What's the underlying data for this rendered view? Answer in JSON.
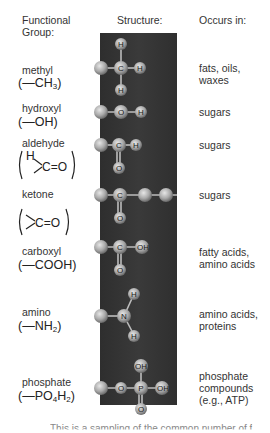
{
  "headers": {
    "group": "Functional Group:",
    "group_line1": "Functional",
    "group_line2": "Group:",
    "structure": "Structure:",
    "occurs": "Occurs in:"
  },
  "groups": [
    {
      "name": "methyl",
      "formula_prefix": "(—CH",
      "formula_sub": "3",
      "formula_suffix": ")",
      "occurs": "fats, oils,\nwaxes",
      "structure_atoms": [
        "C",
        "H",
        "H",
        "H"
      ]
    },
    {
      "name": "hydroxyl",
      "formula_prefix": "(—OH)",
      "formula_sub": "",
      "formula_suffix": "",
      "occurs": "sugars",
      "structure_atoms": [
        "O",
        "H"
      ]
    },
    {
      "name": "aldehyde",
      "formula_prefix": "H",
      "formula_sub": "",
      "formula_suffix": "C=O",
      "occurs": "sugars",
      "structure_atoms": [
        "C",
        "H",
        "O"
      ]
    },
    {
      "name": "ketone",
      "formula_prefix": "",
      "formula_sub": "",
      "formula_suffix": "C=O",
      "occurs": "sugars",
      "structure_atoms": [
        "C",
        "O"
      ]
    },
    {
      "name": "carboxyl",
      "formula_prefix": "(—COOH)",
      "formula_sub": "",
      "formula_suffix": "",
      "occurs": "fatty acids,\namino acids",
      "structure_atoms": [
        "C",
        "OH",
        "O"
      ]
    },
    {
      "name": "amino",
      "formula_prefix": "(—NH",
      "formula_sub": "2",
      "formula_suffix": ")",
      "occurs": "amino acids,\nproteins",
      "structure_atoms": [
        "N",
        "H",
        "H"
      ]
    },
    {
      "name": "phosphate",
      "formula_prefix": "(—PO",
      "formula_sub": "4",
      "formula_mid": "H",
      "formula_sub2": "2",
      "formula_suffix": ")",
      "occurs": "phosphate\ncompounds\n(e.g., ATP)",
      "structure_atoms": [
        "O",
        "P",
        "OH",
        "OH",
        "O"
      ]
    }
  ],
  "atoms": {
    "C": "C",
    "H": "H",
    "O": "O",
    "N": "N",
    "P": "P",
    "OH": "OH"
  },
  "colors": {
    "panel": "#333333",
    "atom": "#b8b8b8",
    "text": "#333333"
  },
  "footer_partial": "This is a sampling of the common number of f"
}
